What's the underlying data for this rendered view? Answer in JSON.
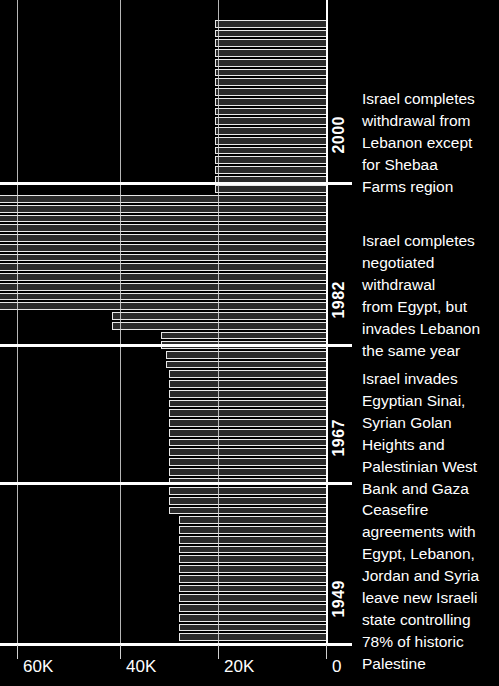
{
  "chart_data": {
    "type": "bar",
    "orientation": "horizontal",
    "title": "",
    "xlabel": "",
    "ylabel": "",
    "xlim": [
      0,
      65000
    ],
    "x_axis_direction": "right-to-left",
    "grid": true,
    "legend": "none",
    "background": "#000000",
    "bar_fill": "#2a2a2a",
    "bar_stroke": "#e8e8e8",
    "axis_color": "#ffffff",
    "xticks": [
      {
        "label": "60K",
        "value": 60000
      },
      {
        "label": "40K",
        "value": 40000
      },
      {
        "label": "20K",
        "value": 20000
      },
      {
        "label": "0",
        "value": 0
      }
    ],
    "categories": [
      "1949",
      "1950",
      "1951",
      "1952",
      "1953",
      "1954",
      "1955",
      "1956",
      "1957",
      "1958",
      "1959",
      "1960",
      "1961",
      "1962",
      "1963",
      "1964",
      "1965",
      "1966",
      "1967",
      "1968",
      "1969",
      "1970",
      "1971",
      "1972",
      "1973",
      "1974",
      "1975",
      "1976",
      "1977",
      "1978",
      "1979",
      "1980",
      "1981",
      "1982",
      "1983",
      "1984",
      "1985",
      "1986",
      "1987",
      "1988",
      "1989",
      "1990",
      "1991",
      "1992",
      "1993",
      "1994",
      "1995",
      "1996",
      "1997",
      "1998",
      "1999",
      "2000",
      "2001",
      "2002",
      "2003",
      "2004",
      "2005",
      "2006",
      "2007",
      "2008",
      "2009",
      "2010",
      "2011",
      "2012"
    ],
    "values": [
      21500,
      21500,
      21500,
      21500,
      21500,
      21500,
      21500,
      21500,
      21500,
      21500,
      21500,
      21500,
      21500,
      21500,
      21500,
      21500,
      21500,
      21500,
      63500,
      63500,
      63500,
      63500,
      63500,
      63500,
      63500,
      63500,
      63500,
      63500,
      63500,
      63500,
      41500,
      41500,
      32000,
      32000,
      31000,
      31000,
      30500,
      30500,
      30500,
      30500,
      30500,
      30500,
      30500,
      30500,
      30500,
      30500,
      30500,
      30500,
      30500,
      30500,
      30500,
      28500,
      28500,
      28500,
      28500,
      28500,
      28500,
      28500,
      28500,
      28500,
      28500,
      28500,
      28500,
      28500
    ],
    "annotations": [
      {
        "year": "2000",
        "text": "Israel completes\nwithdrawal from\nLebanon except\nfor Shebaa\nFarms region"
      },
      {
        "year": "1982",
        "text": "Israel completes\nnegotiated\nwithdrawal\nfrom Egypt, but\ninvades Lebanon\nthe same year"
      },
      {
        "year": "1967",
        "text": "Israel invades\nEgyptian Sinai,\nSyrian Golan\nHeights and\nPalestinian West\nBank and Gaza"
      },
      {
        "year": "1949",
        "text": "Ceasefire\nagreements with\nEgypt, Lebanon,\nJordan and Syria\nleave new Israeli\nstate controlling\n78% of historic\nPalestine"
      }
    ]
  }
}
